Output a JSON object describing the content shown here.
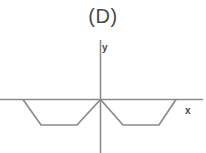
{
  "figure": {
    "panel_label": "(D)",
    "background_color": "#ffffff",
    "line_color": "#8a8a8a",
    "axis_color": "#8c8c8c",
    "label_color": "#4a4a4a"
  },
  "axes": {
    "x_label": "x",
    "y_label": "y",
    "x_axis": {
      "x1": 0,
      "y1": 99.5,
      "x2": 203,
      "y2": 99.5
    },
    "y_axis": {
      "x1": 100.5,
      "y1": 40,
      "x2": 100.5,
      "y2": 153
    },
    "x_label_pos": {
      "x": 188,
      "y": 111
    },
    "y_label_pos": {
      "x": 104,
      "y": 49
    }
  },
  "chart_data": {
    "type": "line",
    "title": "(D)",
    "xlabel": "x",
    "ylabel": "y",
    "grid": false,
    "legend": null,
    "xlim": [
      -6,
      6
    ],
    "ylim": [
      -2,
      1
    ],
    "series": [
      {
        "name": "f(x)",
        "points": [
          {
            "x": -5.0,
            "y": 0.0,
            "px": 23,
            "py": 99.5
          },
          {
            "x": -3.8,
            "y": -1.0,
            "px": 41,
            "py": 125
          },
          {
            "x": -1.5,
            "y": -1.0,
            "px": 77,
            "py": 125
          },
          {
            "x": 0.0,
            "y": 0.0,
            "px": 100.5,
            "py": 99.5
          },
          {
            "x": 1.5,
            "y": -1.0,
            "px": 123,
            "py": 125
          },
          {
            "x": 3.8,
            "y": -1.0,
            "px": 159,
            "py": 125
          },
          {
            "x": 5.0,
            "y": 0.0,
            "px": 176,
            "py": 99.5
          }
        ]
      }
    ],
    "path_pixels": "23,99.5 41,125 77,125 100.5,99.5 123,125 159,125 176,99.5"
  }
}
